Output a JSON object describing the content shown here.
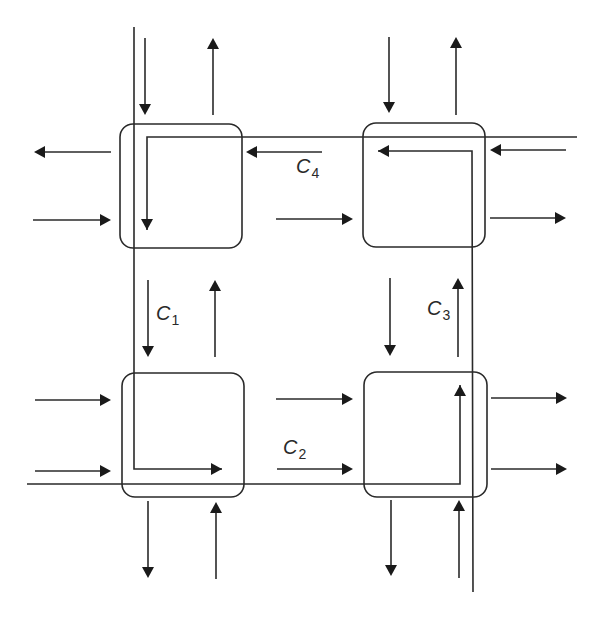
{
  "diagram": {
    "title": "",
    "colors": {
      "stroke": "#2a2a2a",
      "arrowhead": "#1a1a1a",
      "background": "#ffffff"
    },
    "intersections": [
      {
        "id": "top-left",
        "x": 120,
        "y": 124,
        "w": 122,
        "h": 124
      },
      {
        "id": "top-right",
        "x": 363,
        "y": 123,
        "w": 122,
        "h": 124
      },
      {
        "id": "bottom-left",
        "x": 122,
        "y": 373,
        "w": 122,
        "h": 124
      },
      {
        "id": "bottom-right",
        "x": 364,
        "y": 372,
        "w": 123,
        "h": 125
      }
    ],
    "routes": [
      {
        "id": "C1",
        "label": "C",
        "sub": "1",
        "points": "134,27 134,469 212,469",
        "head": "right",
        "hx": 222,
        "hy": 469,
        "lx": 156,
        "ly": 303
      },
      {
        "id": "C2",
        "label": "C",
        "sub": "2",
        "points": "27,484 460,484 460,395",
        "head": "up",
        "hx": 460,
        "hy": 385,
        "lx": 283,
        "ly": 437
      },
      {
        "id": "C3",
        "label": "C",
        "sub": "3",
        "points": "473,592 472,151 388,151",
        "head": "left",
        "hx": 378,
        "hy": 151,
        "lx": 427,
        "ly": 298
      },
      {
        "id": "C4",
        "label": "C",
        "sub": "4",
        "points": "577,137 147,137 147,220",
        "head": "down",
        "hx": 147,
        "hy": 230,
        "lx": 296,
        "ly": 156
      }
    ],
    "lanes": [
      {
        "dir": "down",
        "x1": 145,
        "y1": 38,
        "x2": 145,
        "y2": 115
      },
      {
        "dir": "up",
        "x1": 213,
        "y1": 115,
        "x2": 213,
        "y2": 38
      },
      {
        "dir": "left",
        "x1": 111,
        "y1": 152,
        "x2": 34,
        "y2": 152
      },
      {
        "dir": "right",
        "x1": 33,
        "y1": 220,
        "x2": 111,
        "y2": 220
      },
      {
        "dir": "left",
        "x1": 322,
        "y1": 152,
        "x2": 246,
        "y2": 152
      },
      {
        "dir": "right",
        "x1": 276,
        "y1": 219,
        "x2": 353,
        "y2": 219
      },
      {
        "dir": "down",
        "x1": 389,
        "y1": 37,
        "x2": 389,
        "y2": 113
      },
      {
        "dir": "up",
        "x1": 456,
        "y1": 115,
        "x2": 456,
        "y2": 37
      },
      {
        "dir": "left",
        "x1": 566,
        "y1": 150,
        "x2": 490,
        "y2": 150
      },
      {
        "dir": "right",
        "x1": 490,
        "y1": 218,
        "x2": 566,
        "y2": 218
      },
      {
        "dir": "down",
        "x1": 148,
        "y1": 280,
        "x2": 148,
        "y2": 357
      },
      {
        "dir": "up",
        "x1": 215,
        "y1": 357,
        "x2": 215,
        "y2": 280
      },
      {
        "dir": "down",
        "x1": 390,
        "y1": 278,
        "x2": 390,
        "y2": 356
      },
      {
        "dir": "up",
        "x1": 458,
        "y1": 357,
        "x2": 458,
        "y2": 278
      },
      {
        "dir": "right",
        "x1": 35,
        "y1": 400,
        "x2": 111,
        "y2": 400
      },
      {
        "dir": "right",
        "x1": 35,
        "y1": 471,
        "x2": 111,
        "y2": 471
      },
      {
        "dir": "right",
        "x1": 276,
        "y1": 399,
        "x2": 353,
        "y2": 399
      },
      {
        "dir": "right",
        "x1": 277,
        "y1": 469,
        "x2": 353,
        "y2": 469
      },
      {
        "dir": "right",
        "x1": 491,
        "y1": 398,
        "x2": 567,
        "y2": 398
      },
      {
        "dir": "right",
        "x1": 491,
        "y1": 469,
        "x2": 567,
        "y2": 469
      },
      {
        "dir": "down",
        "x1": 148,
        "y1": 501,
        "x2": 148,
        "y2": 578
      },
      {
        "dir": "up",
        "x1": 216,
        "y1": 579,
        "x2": 216,
        "y2": 502
      },
      {
        "dir": "down",
        "x1": 391,
        "y1": 500,
        "x2": 391,
        "y2": 576
      },
      {
        "dir": "up",
        "x1": 459,
        "y1": 578,
        "x2": 459,
        "y2": 500
      }
    ]
  },
  "labels": {
    "c1": {
      "main": "C",
      "sub": "1"
    },
    "c2": {
      "main": "C",
      "sub": "2"
    },
    "c3": {
      "main": "C",
      "sub": "3"
    },
    "c4": {
      "main": "C",
      "sub": "4"
    }
  }
}
